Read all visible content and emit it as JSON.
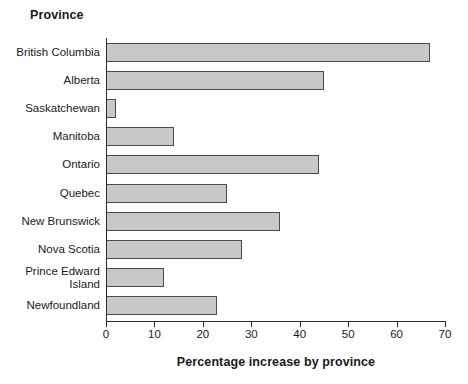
{
  "chart_data": {
    "type": "bar",
    "orientation": "horizontal",
    "title": "",
    "xlabel": "Percentage increase by province",
    "ylabel": "Province",
    "categories": [
      "British Columbia",
      "Alberta",
      "Saskatchewan",
      "Manitoba",
      "Ontario",
      "Quebec",
      "New Brunswick",
      "Nova Scotia",
      "Prince Edward\nIsland",
      "Newfoundland"
    ],
    "values": [
      67,
      45,
      2,
      14,
      44,
      25,
      36,
      28,
      12,
      23
    ],
    "xlim": [
      0,
      70
    ],
    "xticks": [
      0,
      10,
      20,
      30,
      40,
      50,
      60,
      70
    ],
    "xtick_labels": [
      "0",
      "10",
      "20",
      "30",
      "40",
      "50",
      "60",
      "70"
    ],
    "grid": false,
    "legend": false,
    "bar_color": "#c8c8c8",
    "bar_edge_color": "#4a4a4a",
    "axis_color": "#2b2b2b",
    "background": "#ffffff"
  }
}
